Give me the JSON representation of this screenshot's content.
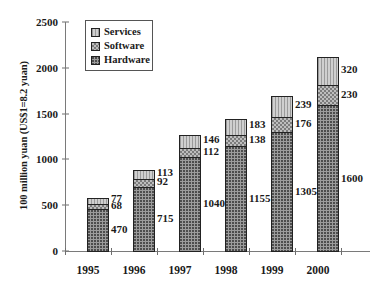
{
  "chart_data": {
    "type": "bar",
    "subtype": "stacked-vertical",
    "title": "",
    "xlabel": "",
    "ylabel": "100 million yuan (US$1=8.2 yuan)",
    "categories": [
      "1995",
      "1996",
      "1997",
      "1998",
      "1999",
      "2000"
    ],
    "series": [
      {
        "name": "Hardware",
        "values": [
          470,
          715,
          1040,
          1155,
          1305,
          1600
        ]
      },
      {
        "name": "Software",
        "values": [
          68,
          92,
          112,
          138,
          176,
          230
        ]
      },
      {
        "name": "Services",
        "values": [
          77,
          113,
          146,
          183,
          239,
          320
        ]
      }
    ],
    "stack_order_bottom_to_top": [
      "Hardware",
      "Software",
      "Services"
    ],
    "totals": [
      615,
      920,
      1298,
      1476,
      1720,
      2150
    ],
    "ylim": [
      0,
      2500
    ],
    "yticks": [
      0,
      500,
      1000,
      1500,
      2000,
      2500
    ],
    "ytick_labels": [
      "0",
      "500",
      "1000",
      "1500",
      "2000",
      "2500"
    ],
    "grid": false,
    "legend_position": "top-left-inside",
    "data_labels": true,
    "colors": {
      "hardware": "#9c9c9c",
      "software": "#bdbdbd",
      "services": "#cfcfcf",
      "outline": "#222222",
      "axis": "#7a7a7a",
      "text": "#1a1a1a",
      "background": "#ffffff"
    }
  },
  "legend": {
    "items": [
      {
        "label": "Services",
        "swatch": "services-swatch"
      },
      {
        "label": "Software",
        "swatch": "software-swatch"
      },
      {
        "label": "Hardware",
        "swatch": "hardware-swatch"
      }
    ]
  }
}
